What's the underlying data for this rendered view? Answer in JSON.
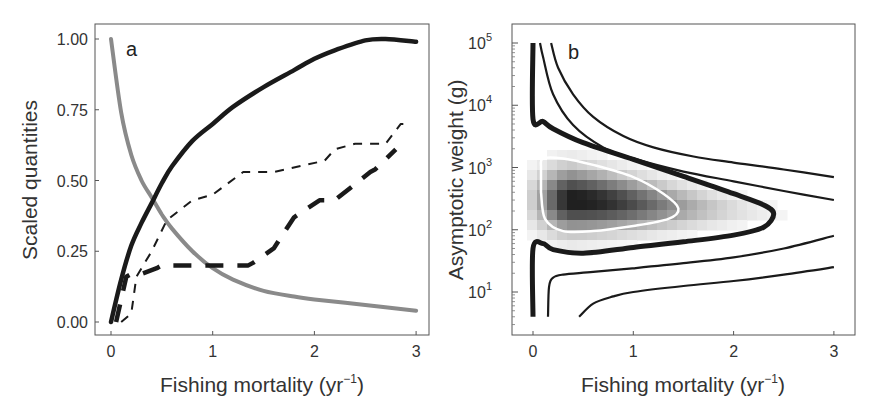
{
  "chart_data": [
    {
      "panel": "a",
      "type": "line",
      "panel_label": "a",
      "xlabel": "Fishing mortality (yr",
      "xlabel_sup": "−1",
      "xlabel_close": ")",
      "ylabel": "Scaled quantities",
      "xlim": [
        0,
        3
      ],
      "ylim": [
        0,
        1
      ],
      "grid": false,
      "legend": "none",
      "x_ticks": [
        "0",
        "1",
        "2",
        "3"
      ],
      "y_ticks": [
        "0.00",
        "0.25",
        "0.50",
        "0.75",
        "1.00"
      ],
      "series": [
        {
          "name": "gray-solid-decreasing",
          "style": "solid",
          "color": "#8a8a8a",
          "width": 4,
          "x": [
            0,
            0.1,
            0.2,
            0.3,
            0.4,
            0.5,
            0.6,
            0.8,
            1.0,
            1.2,
            1.5,
            1.8,
            2.0,
            2.5,
            3.0
          ],
          "y": [
            1.0,
            0.74,
            0.59,
            0.5,
            0.44,
            0.38,
            0.33,
            0.25,
            0.19,
            0.15,
            0.11,
            0.09,
            0.08,
            0.06,
            0.04
          ]
        },
        {
          "name": "black-solid-increasing",
          "style": "solid",
          "color": "#1a1a1a",
          "width": 4.5,
          "x": [
            0,
            0.1,
            0.2,
            0.3,
            0.4,
            0.5,
            0.6,
            0.8,
            1.0,
            1.2,
            1.5,
            1.8,
            2.0,
            2.2,
            2.5,
            2.7,
            3.0
          ],
          "y": [
            0.0,
            0.15,
            0.27,
            0.35,
            0.42,
            0.49,
            0.55,
            0.64,
            0.7,
            0.76,
            0.83,
            0.89,
            0.93,
            0.96,
            0.995,
            1.0,
            0.99
          ]
        },
        {
          "name": "black-thin-dashed",
          "style": "dashed",
          "color": "#1a1a1a",
          "width": 2,
          "x": [
            0.1,
            0.2,
            0.25,
            0.4,
            0.55,
            0.8,
            1.0,
            1.3,
            1.6,
            2.1,
            2.2,
            2.4,
            2.7,
            2.85,
            2.95
          ],
          "y": [
            0.0,
            0.03,
            0.16,
            0.25,
            0.36,
            0.43,
            0.45,
            0.53,
            0.53,
            0.57,
            0.61,
            0.63,
            0.63,
            0.7,
            0.7
          ]
        },
        {
          "name": "black-thick-dashed",
          "style": "dashed",
          "color": "#1a1a1a",
          "width": 4.5,
          "x": [
            0.05,
            0.15,
            0.2,
            0.3,
            0.45,
            0.5,
            1.0,
            1.35,
            1.4,
            1.6,
            1.8,
            2.05,
            2.2,
            2.55,
            2.6,
            2.8
          ],
          "y": [
            0.0,
            0.16,
            0.17,
            0.17,
            0.19,
            0.2,
            0.2,
            0.2,
            0.21,
            0.26,
            0.37,
            0.43,
            0.43,
            0.53,
            0.54,
            0.61
          ]
        }
      ]
    },
    {
      "panel": "b",
      "type": "heatmap",
      "panel_label": "b",
      "xlabel": "Fishing mortality (yr",
      "xlabel_sup": "−1",
      "xlabel_close": ")",
      "ylabel": "Asymptotic weight (g)",
      "xlim": [
        0,
        3
      ],
      "ylim": [
        4,
        100000
      ],
      "yscale": "log",
      "grid": false,
      "legend": "none",
      "x_ticks": [
        "0",
        "1",
        "2",
        "3"
      ],
      "y_ticks": [
        {
          "base": "10",
          "exp": "1"
        },
        {
          "base": "10",
          "exp": "2"
        },
        {
          "base": "10",
          "exp": "3"
        },
        {
          "base": "10",
          "exp": "4"
        },
        {
          "base": "10",
          "exp": "5"
        }
      ],
      "heatmap": {
        "description": "grayscale intensity, darkest near F=0.4, W=300 g",
        "peak": {
          "F": 0.4,
          "W": 300
        },
        "color_low": "#ffffff",
        "color_high": "#1a1a1a"
      },
      "contours": [
        {
          "name": "white-contour-inner",
          "color": "#ffffff",
          "width": 2.5,
          "closed": true,
          "F": [
            0.08,
            0.1,
            0.3,
            0.6,
            1.0,
            1.3,
            1.45,
            1.35,
            1.0,
            0.6,
            0.3,
            0.12,
            0.08
          ],
          "W": [
            1000,
            1400,
            1400,
            1100,
            700,
            380,
            220,
            150,
            115,
            95,
            95,
            150,
            400
          ]
        },
        {
          "name": "thick-black-contour",
          "color": "#1a1a1a",
          "width": 5,
          "closed": false,
          "F": [
            0,
            0,
            0.1,
            0.2,
            0.5,
            1.0,
            1.5,
            2.0,
            2.3,
            2.4,
            2.3,
            2.0,
            1.5,
            1.0,
            0.5,
            0.2,
            0.1,
            0,
            0
          ],
          "W": [
            100000,
            6000,
            5500,
            4200,
            2500,
            1350,
            720,
            380,
            250,
            180,
            110,
            82,
            64,
            52,
            42,
            48,
            60,
            50,
            4
          ]
        },
        {
          "name": "thin-contour-upper-1",
          "color": "#1a1a1a",
          "width": 2.2,
          "closed": false,
          "F": [
            0.07,
            0.1,
            0.2,
            0.4,
            0.7,
            1.0,
            1.5,
            2.0,
            2.5,
            3.0
          ],
          "W": [
            100000,
            60000,
            15000,
            4800,
            2100,
            1400,
            860,
            600,
            420,
            300
          ]
        },
        {
          "name": "thin-contour-upper-2",
          "color": "#1a1a1a",
          "width": 2.2,
          "closed": false,
          "F": [
            0.18,
            0.25,
            0.4,
            0.6,
            0.9,
            1.2,
            1.6,
            2.0,
            2.5,
            3.0
          ],
          "W": [
            100000,
            40000,
            15000,
            6500,
            3200,
            2100,
            1500,
            1200,
            930,
            700
          ]
        },
        {
          "name": "thin-contour-lower-1",
          "color": "#1a1a1a",
          "width": 2.2,
          "closed": false,
          "F": [
            0.15,
            0.16,
            0.2,
            0.3,
            0.6,
            1.0,
            1.5,
            2.0,
            2.5,
            3.0
          ],
          "W": [
            4,
            12,
            17,
            19,
            21,
            24,
            29,
            36,
            50,
            80
          ]
        },
        {
          "name": "thin-contour-lower-2",
          "color": "#1a1a1a",
          "width": 2.2,
          "closed": false,
          "F": [
            0.46,
            0.6,
            0.8,
            1.0,
            1.5,
            2.0,
            2.5,
            3.0
          ],
          "W": [
            4,
            6.5,
            8.5,
            10,
            12.5,
            15,
            19,
            25
          ]
        }
      ]
    }
  ]
}
